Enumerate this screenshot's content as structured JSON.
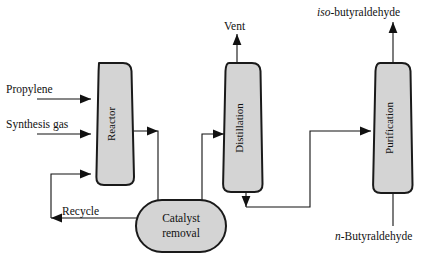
{
  "diagram": {
    "colors": {
      "vessel_fill": "#d4d4d4",
      "vessel_stroke": "#1a1a1a",
      "line": "#111111",
      "background": "#ffffff"
    },
    "units": [
      {
        "id": "reactor",
        "label": "Reactor",
        "shape": "barrel-column"
      },
      {
        "id": "distillation",
        "label": "Distillation",
        "shape": "barrel-column"
      },
      {
        "id": "purification",
        "label": "Purification",
        "shape": "barrel-column"
      },
      {
        "id": "catalyst-removal",
        "label_line1": "Catalyst",
        "label_line2": "removal",
        "shape": "stadium"
      }
    ],
    "streams": [
      {
        "id": "propylene",
        "label": "Propylene",
        "direction": "into-reactor"
      },
      {
        "id": "synthesis-gas",
        "label": "Synthesis gas",
        "direction": "into-reactor"
      },
      {
        "id": "recycle",
        "label": "Recycle",
        "direction": "catalyst-removal-to-reactor"
      },
      {
        "id": "vent",
        "label": "Vent",
        "direction": "out-of-distillation-top"
      },
      {
        "id": "iso-butyraldehyde",
        "label_italic": "iso",
        "label_rest": "-butyraldehyde",
        "direction": "out-of-purification-top"
      },
      {
        "id": "n-butyraldehyde",
        "label_italic": "n",
        "label_rest": "-Butyraldehyde",
        "direction": "out-of-purification-bottom"
      }
    ]
  }
}
